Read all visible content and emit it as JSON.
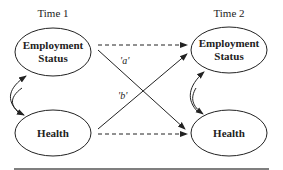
{
  "diagram": {
    "time_labels": [
      "Time 1",
      "Time 2"
    ],
    "nodes": {
      "t1_employment": {
        "line1": "Employment",
        "line2": "Status"
      },
      "t1_health": {
        "label": "Health"
      },
      "t2_employment": {
        "line1": "Employment",
        "line2": "Status"
      },
      "t2_health": {
        "label": "Health"
      }
    },
    "path_labels": {
      "a": "'a'",
      "b": "'b'"
    },
    "edges": [
      {
        "from": "t1_employment",
        "to": "t2_employment",
        "style": "dashed"
      },
      {
        "from": "t1_health",
        "to": "t2_health",
        "style": "dashed"
      },
      {
        "from": "t1_employment",
        "to": "t2_health",
        "style": "solid",
        "label": "'a'"
      },
      {
        "from": "t1_health",
        "to": "t2_employment",
        "style": "solid",
        "label": "'b'"
      },
      {
        "from": "t1_employment",
        "to": "t1_health",
        "style": "curved-double-arrow"
      },
      {
        "from": "t2_employment",
        "to": "t2_health",
        "style": "curved-double-arrow"
      }
    ],
    "colors": {
      "stroke": "#222222",
      "rule": "#555555"
    }
  }
}
